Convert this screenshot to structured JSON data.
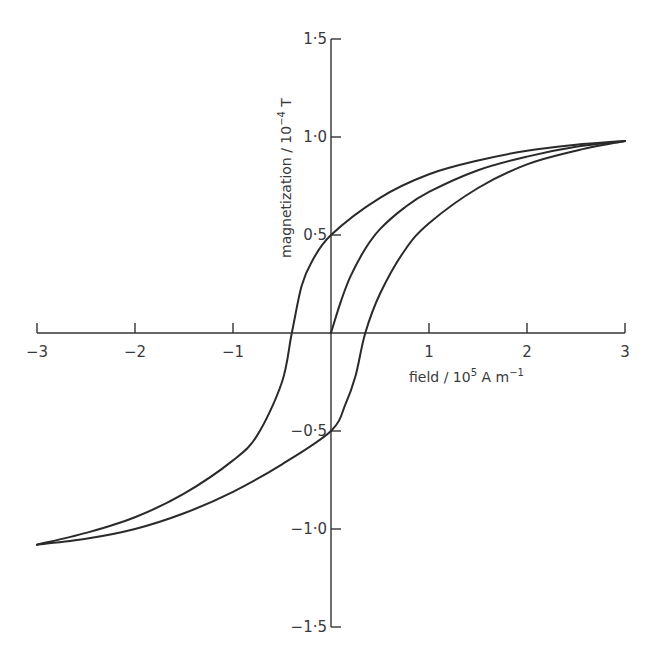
{
  "chart_data": {
    "type": "line",
    "title": "",
    "xlabel": "field / 10^5 A m^-1",
    "ylabel": "magnetization / 10^-4 T",
    "xlim": [
      -3,
      3
    ],
    "ylim": [
      -1.5,
      1.5
    ],
    "grid": false,
    "legend": null,
    "x_ticks": [
      -3,
      -2,
      -1,
      0,
      1,
      2,
      3
    ],
    "x_tick_labels": [
      "−3",
      "−2",
      "−1",
      "",
      "1",
      "2",
      "3"
    ],
    "y_ticks": [
      1.5,
      1.0,
      0.5,
      -0.5,
      -1.0,
      -1.5
    ],
    "y_tick_labels": [
      "1·5",
      "1·0",
      "0·5",
      "−0·5",
      "−1·0",
      "−1·5"
    ],
    "series": [
      {
        "name": "initial magnetization curve",
        "x": [
          0,
          0.1,
          0.2,
          0.35,
          0.5,
          0.75,
          1.0,
          1.5,
          2.0,
          2.5,
          3.0
        ],
        "y": [
          0,
          0.16,
          0.29,
          0.43,
          0.53,
          0.64,
          0.72,
          0.83,
          0.9,
          0.95,
          0.98
        ]
      },
      {
        "name": "descending branch",
        "x": [
          3.0,
          2.5,
          2.0,
          1.5,
          1.0,
          0.5,
          0.0,
          -0.2,
          -0.3,
          -0.4,
          -0.5,
          -0.75,
          -1.0,
          -1.5,
          -2.0,
          -2.5,
          -3.0
        ],
        "y": [
          0.98,
          0.96,
          0.93,
          0.88,
          0.81,
          0.69,
          0.5,
          0.36,
          0.24,
          0.0,
          -0.25,
          -0.52,
          -0.65,
          -0.82,
          -0.94,
          -1.02,
          -1.08
        ]
      },
      {
        "name": "ascending branch",
        "x": [
          -3.0,
          -2.5,
          -2.0,
          -1.5,
          -1.0,
          -0.5,
          0.0,
          0.15,
          0.25,
          0.35,
          0.5,
          0.75,
          1.0,
          1.5,
          2.0,
          2.5,
          3.0
        ],
        "y": [
          -1.08,
          -1.05,
          -1.0,
          -0.92,
          -0.81,
          -0.67,
          -0.5,
          -0.36,
          -0.22,
          0.0,
          0.2,
          0.42,
          0.56,
          0.74,
          0.86,
          0.93,
          0.98
        ]
      }
    ],
    "annotations": {
      "remanence": [
        0.5,
        -0.5
      ],
      "coercivity": [
        -0.4,
        0.35
      ]
    }
  },
  "axis_titles": {
    "x_main": "field / 10",
    "x_exp": "5",
    "x_unit": " A m",
    "x_unit_exp": "−1",
    "y_main": "magnetization / 10",
    "y_exp": "−4",
    "y_unit": " T"
  },
  "caption": {
    "visible": "clipped"
  }
}
